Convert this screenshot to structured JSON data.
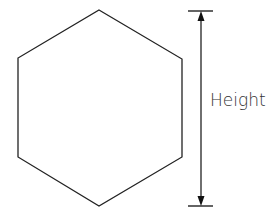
{
  "diagram": {
    "shape": "regular-hexagon",
    "dimension_label": "Height",
    "colors": {
      "stroke": "#222222",
      "text": "#333333",
      "background": "#ffffff"
    }
  }
}
